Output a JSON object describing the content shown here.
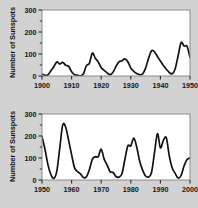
{
  "figure": {
    "background_color": "#d2d2d2",
    "plot_background_color": "#ffffff",
    "frame_color": "#8a8a8a",
    "curve_color": "#111111"
  },
  "chart_data": [
    {
      "type": "line",
      "title": "",
      "xlabel": "",
      "ylabel": "Number of Sunspots",
      "xlim": [
        1900,
        1950
      ],
      "ylim": [
        0,
        300
      ],
      "xticks": [
        1900,
        1910,
        1920,
        1930,
        1940,
        1950
      ],
      "xticklabels": [
        "1900",
        "1910",
        "1920",
        "1930",
        "1940",
        "1950"
      ],
      "yticks": [
        0,
        100,
        200,
        300
      ],
      "yticklabels": [
        "0",
        "100",
        "200",
        "300"
      ],
      "minor_yticks": [
        50,
        150,
        250
      ],
      "grid": false,
      "legend": null,
      "x": [
        1900,
        1901,
        1902,
        1903,
        1904,
        1905,
        1906,
        1907,
        1908,
        1909,
        1910,
        1911,
        1912,
        1913,
        1914,
        1915,
        1916,
        1917,
        1918,
        1919,
        1920,
        1921,
        1922,
        1923,
        1924,
        1925,
        1926,
        1927,
        1928,
        1929,
        1930,
        1931,
        1932,
        1933,
        1934,
        1935,
        1936,
        1937,
        1938,
        1939,
        1940,
        1941,
        1942,
        1943,
        1944,
        1945,
        1946,
        1947,
        1948,
        1949,
        1950
      ],
      "values": [
        9,
        3,
        5,
        24,
        42,
        64,
        54,
        62,
        49,
        44,
        19,
        6,
        4,
        1,
        10,
        47,
        57,
        104,
        81,
        64,
        38,
        26,
        14,
        6,
        17,
        44,
        64,
        69,
        78,
        65,
        36,
        21,
        11,
        6,
        9,
        36,
        80,
        114,
        110,
        89,
        68,
        48,
        31,
        16,
        10,
        33,
        93,
        152,
        136,
        135,
        84
      ],
      "series": [
        {
          "name": "Sunspot number 1900-1950",
          "peaks": [
            {
              "year": 1906,
              "value": 110
            },
            {
              "year": 1918,
              "value": 150
            },
            {
              "year": 1928,
              "value": 120
            },
            {
              "year": 1939,
              "value": 157
            },
            {
              "year": 1950,
              "value": 203
            }
          ],
          "troughs": [
            {
              "year": 1901,
              "value": 8
            },
            {
              "year": 1912,
              "value": 3
            },
            {
              "year": 1923,
              "value": 6
            },
            {
              "year": 1934,
              "value": 5
            },
            {
              "year": 1945,
              "value": 4
            }
          ]
        }
      ]
    },
    {
      "type": "line",
      "title": "",
      "xlabel": "",
      "ylabel": "Number of Sunspots",
      "xlim": [
        1950,
        2000
      ],
      "ylim": [
        0,
        300
      ],
      "xticks": [
        1950,
        1960,
        1970,
        1980,
        1990,
        2000
      ],
      "xticklabels": [
        "1950",
        "1960",
        "1970",
        "1980",
        "1990",
        "2000"
      ],
      "yticks": [
        0,
        100,
        200,
        300
      ],
      "yticklabels": [
        "0",
        "100",
        "200",
        "300"
      ],
      "minor_yticks": [
        50,
        150,
        250
      ],
      "grid": false,
      "legend": null,
      "x": [
        1950,
        1951,
        1952,
        1953,
        1954,
        1955,
        1956,
        1957,
        1958,
        1959,
        1960,
        1961,
        1962,
        1963,
        1964,
        1965,
        1966,
        1967,
        1968,
        1969,
        1970,
        1971,
        1972,
        1973,
        1974,
        1975,
        1976,
        1977,
        1978,
        1979,
        1980,
        1981,
        1982,
        1983,
        1984,
        1985,
        1986,
        1987,
        1988,
        1989,
        1990,
        1991,
        1992,
        1993,
        1994,
        1995,
        1996,
        1997,
        1998,
        1999,
        2000
      ],
      "values": [
        197,
        140,
        70,
        25,
        7,
        40,
        145,
        250,
        240,
        180,
        115,
        55,
        38,
        28,
        11,
        15,
        47,
        94,
        106,
        106,
        140,
        95,
        68,
        38,
        34,
        16,
        13,
        28,
        93,
        155,
        155,
        190,
        150,
        85,
        45,
        18,
        14,
        34,
        123,
        211,
        146,
        180,
        192,
        110,
        55,
        30,
        9,
        21,
        64,
        93,
        100
      ]
    }
  ]
}
